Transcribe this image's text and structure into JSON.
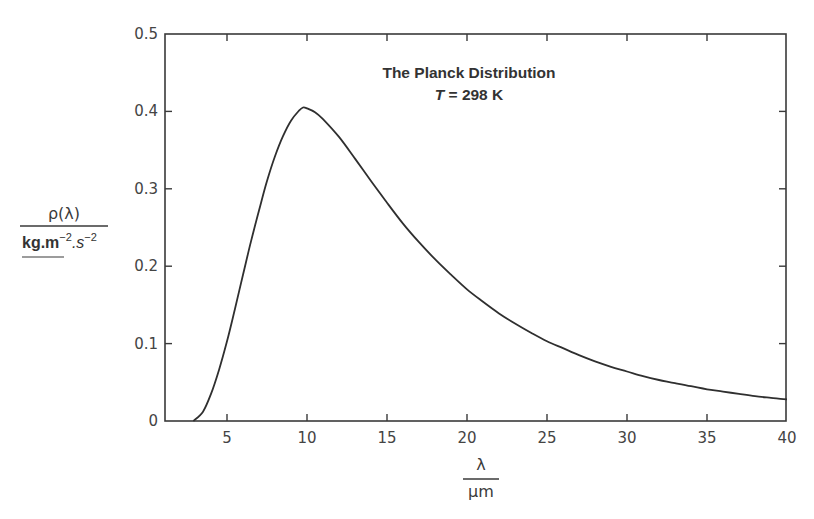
{
  "chart_data": {
    "type": "line",
    "title": "The Planck Distribution",
    "subtitle": "T = 298 K",
    "subtitle_var": "T",
    "subtitle_rest": " = 298 K",
    "xlabel": "λ",
    "xlabel_units": "μm",
    "ylabel": "ρ(λ)",
    "ylabel_units": {
      "base1": "kg.m",
      "exp1": "−2",
      "base2": ".s",
      "exp2": "−2"
    },
    "xlim": [
      1.1,
      40
    ],
    "ylim": [
      0,
      0.5
    ],
    "grid": false,
    "legend": "none",
    "x_ticks": [
      5,
      10,
      15,
      20,
      25,
      30,
      35,
      40
    ],
    "x_tick_labels": [
      "5",
      "10",
      "15",
      "20",
      "25",
      "30",
      "35",
      "40"
    ],
    "y_ticks": [
      0,
      0.1,
      0.2,
      0.3,
      0.4,
      0.5
    ],
    "y_tick_labels": [
      "0",
      "0.1",
      "0.2",
      "0.3",
      "0.4",
      "0.5"
    ],
    "series": [
      {
        "name": "ρ(λ) at T = 298 K",
        "color": "#2f2f2f",
        "x": [
          2.9,
          3.5,
          4.0,
          4.5,
          5.0,
          5.5,
          6.0,
          6.5,
          7.0,
          7.5,
          8.0,
          8.5,
          9.0,
          9.5,
          9.75,
          10.0,
          10.5,
          11.0,
          12.0,
          13.0,
          14.0,
          15.0,
          16.0,
          17.0,
          18.0,
          19.0,
          20.0,
          21.0,
          22.0,
          23.0,
          24.0,
          25.0,
          26.0,
          27.0,
          28.0,
          29.0,
          30.0,
          31.0,
          32.0,
          33.0,
          34.0,
          35.0,
          36.0,
          37.0,
          38.0,
          39.0,
          40.0
        ],
        "values": [
          0.0,
          0.012,
          0.035,
          0.066,
          0.103,
          0.145,
          0.189,
          0.232,
          0.272,
          0.31,
          0.342,
          0.368,
          0.388,
          0.401,
          0.405,
          0.404,
          0.399,
          0.39,
          0.367,
          0.339,
          0.31,
          0.282,
          0.255,
          0.231,
          0.209,
          0.189,
          0.17,
          0.154,
          0.139,
          0.126,
          0.114,
          0.103,
          0.094,
          0.085,
          0.077,
          0.07,
          0.064,
          0.058,
          0.053,
          0.049,
          0.045,
          0.041,
          0.038,
          0.035,
          0.032,
          0.03,
          0.028
        ]
      }
    ],
    "annotations": [
      {
        "text": "The Planck Distribution",
        "x": 19.5,
        "y": 0.47
      },
      {
        "text": "T = 298 K",
        "x": 19.5,
        "y": 0.44
      }
    ],
    "peak": {
      "x": 9.75,
      "y": 0.405
    }
  },
  "layout": {
    "plot_left": 165,
    "plot_right": 786,
    "plot_top": 34,
    "plot_bottom": 421,
    "x0_px": 147,
    "px_per_x": 16.0,
    "px_per_y": 774
  },
  "colors": {
    "axis": "#3a3a3a",
    "curve": "#2f2f2f",
    "text": "#3a3a3a",
    "background": "#ffffff"
  }
}
